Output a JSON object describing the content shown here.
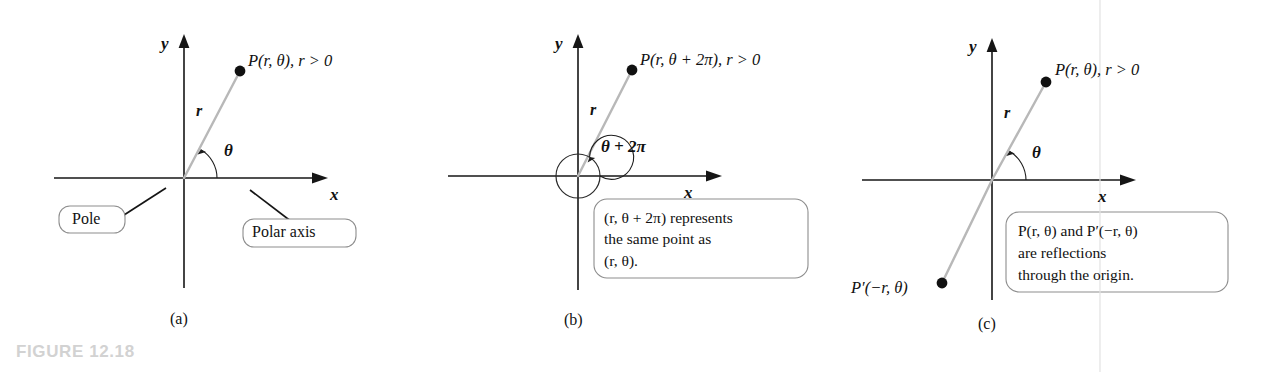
{
  "figure": {
    "caption": "FIGURE 12.18",
    "caption_color": "#d2d2d2",
    "background_color": "#ffffff",
    "radius_line_color": "#b8b8b8",
    "axis_color": "#161616"
  },
  "panels": [
    {
      "id": "a",
      "label": "(a)",
      "axes": {
        "x_label": "x",
        "y_label": "y"
      },
      "radius_label": "r",
      "angle_label": "θ",
      "point_label": "P(r, θ), r > 0",
      "tags": [
        {
          "name": "pole",
          "text": "Pole"
        },
        {
          "name": "polar-axis",
          "text": "Polar axis"
        }
      ]
    },
    {
      "id": "b",
      "label": "(b)",
      "axes": {
        "x_label": "x",
        "y_label": "y"
      },
      "radius_label": "r",
      "angle_label": "θ + 2π",
      "point_label": "P(r, θ + 2π), r > 0",
      "callout": {
        "name": "same-point-callout",
        "lines": [
          "(r, θ + 2π) represents",
          "the same point as",
          "(r, θ)."
        ]
      }
    },
    {
      "id": "c",
      "label": "(c)",
      "axes": {
        "x_label": "x",
        "y_label": "y"
      },
      "radius_label": "r",
      "angle_label": "θ",
      "point_label": "P(r, θ), r > 0",
      "reflected_point_label": "P′(−r, θ)",
      "callout": {
        "name": "reflection-callout",
        "lines": [
          "P(r, θ) and P′(−r, θ)",
          "are reflections",
          "through the origin."
        ]
      }
    }
  ]
}
